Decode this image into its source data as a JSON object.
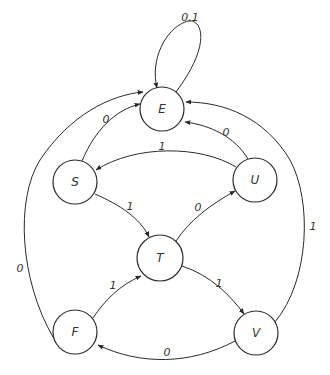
{
  "diagram": {
    "type": "state-transition-diagram",
    "colors": {
      "stroke": "#2a2a2a",
      "text": "#333333",
      "background": "#ffffff"
    },
    "states": [
      {
        "id": "E",
        "label": "E",
        "cx": 162,
        "cy": 109,
        "r": 22
      },
      {
        "id": "S",
        "label": "S",
        "cx": 75,
        "cy": 182,
        "r": 22
      },
      {
        "id": "U",
        "label": "U",
        "cx": 255,
        "cy": 180,
        "r": 22
      },
      {
        "id": "T",
        "label": "T",
        "cx": 160,
        "cy": 258,
        "r": 23
      },
      {
        "id": "F",
        "label": "F",
        "cx": 75,
        "cy": 332,
        "r": 22
      },
      {
        "id": "V",
        "label": "V",
        "cx": 256,
        "cy": 333,
        "r": 22
      }
    ],
    "transitions": [
      {
        "from": "E",
        "to": "E",
        "label": "0,1",
        "path": "M 176 92 C 215 40, 200 15, 185 22 C 165 30, 150 60, 157 88",
        "label_x": 190,
        "label_y": 17
      },
      {
        "from": "S",
        "to": "E",
        "label": "0",
        "path": "M 82 161 C 95 130, 115 110, 140 104",
        "label_x": 106,
        "label_y": 119
      },
      {
        "from": "U",
        "to": "E",
        "label": "0",
        "path": "M 248 159 C 235 137, 210 125, 185 122",
        "label_x": 226,
        "label_y": 132
      },
      {
        "from": "U",
        "to": "S",
        "label": "1",
        "path": "M 236 167 C 200 145, 135 145, 96 170",
        "label_x": 162,
        "label_y": 146
      },
      {
        "from": "S",
        "to": "T",
        "label": "1",
        "path": "M 95 194 C 120 205, 140 218, 149 237",
        "label_x": 130,
        "label_y": 206
      },
      {
        "from": "T",
        "to": "U",
        "label": "0",
        "path": "M 176 241 C 190 220, 210 205, 235 191",
        "label_x": 198,
        "label_y": 207
      },
      {
        "from": "F",
        "to": "T",
        "label": "1",
        "path": "M 93 318 C 105 300, 120 285, 141 276",
        "label_x": 113,
        "label_y": 285
      },
      {
        "from": "T",
        "to": "V",
        "label": "1",
        "path": "M 182 266 C 210 275, 230 295, 244 314",
        "label_x": 219,
        "label_y": 283
      },
      {
        "from": "V",
        "to": "F",
        "label": "0",
        "path": "M 235 341 C 190 365, 140 365, 98 345",
        "label_x": 167,
        "label_y": 352
      },
      {
        "from": "F",
        "to": "E",
        "label": "0",
        "path": "M 53 337 C 20 280, 15 200, 40 160 C 70 115, 110 95, 143 92",
        "label_x": 20,
        "label_y": 268
      },
      {
        "from": "V",
        "to": "E",
        "label": "1",
        "path": "M 275 322 C 310 280, 312 200, 290 160 C 265 118, 225 102, 186 102",
        "label_x": 313,
        "label_y": 226
      }
    ]
  }
}
